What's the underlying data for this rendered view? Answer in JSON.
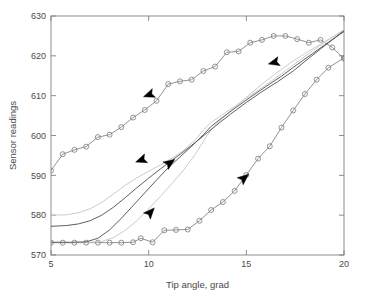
{
  "chart_data": {
    "type": "line",
    "title": "",
    "xlabel": "Tip angle, grad",
    "ylabel": "Sensor readings",
    "xlim": [
      5,
      20
    ],
    "ylim": [
      570,
      630
    ],
    "xticks": [
      5,
      10,
      15,
      20
    ],
    "yticks": [
      570,
      580,
      590,
      600,
      610,
      620,
      630
    ],
    "xtick_labels": [
      "5",
      "10",
      "15",
      "20"
    ],
    "ytick_labels": [
      "570",
      "580",
      "590",
      "600",
      "610",
      "620",
      "630"
    ],
    "grid": false,
    "legend": "none",
    "box": true,
    "colors": {
      "marker_curve": "#808080",
      "dark_line": "#555555",
      "light_line": "#c8c8c8",
      "arrow": "#000000",
      "axis": "#808080",
      "text": "#4a4a4a"
    },
    "series": [
      {
        "name": "upper-branch-markers",
        "style": "line-circle",
        "color": "#808080",
        "marker": "circle",
        "points": [
          [
            5.0,
            591.2
          ],
          [
            5.6,
            595.3
          ],
          [
            6.2,
            596.4
          ],
          [
            6.8,
            597.2
          ],
          [
            7.4,
            599.6
          ],
          [
            8.0,
            600.2
          ],
          [
            8.6,
            602.1
          ],
          [
            9.2,
            604.5
          ],
          [
            9.8,
            606.4
          ],
          [
            10.4,
            608.7
          ],
          [
            11.0,
            612.9
          ],
          [
            11.6,
            613.6
          ],
          [
            12.2,
            614.0
          ],
          [
            12.8,
            616.2
          ],
          [
            13.4,
            617.3
          ],
          [
            14.0,
            620.9
          ],
          [
            14.6,
            621.1
          ],
          [
            15.2,
            623.3
          ],
          [
            15.8,
            624.0
          ],
          [
            16.4,
            625.0
          ],
          [
            17.0,
            625.0
          ],
          [
            17.6,
            624.2
          ],
          [
            18.2,
            623.3
          ],
          [
            18.8,
            624.0
          ],
          [
            19.4,
            622.1
          ],
          [
            20.0,
            619.3
          ]
        ]
      },
      {
        "name": "lower-branch-markers",
        "style": "line-circle",
        "color": "#808080",
        "marker": "circle",
        "points": [
          [
            5.0,
            573.1
          ],
          [
            5.6,
            573.1
          ],
          [
            6.2,
            573.1
          ],
          [
            6.8,
            573.1
          ],
          [
            7.4,
            573.1
          ],
          [
            8.0,
            573.1
          ],
          [
            8.6,
            573.1
          ],
          [
            9.2,
            573.2
          ],
          [
            9.6,
            574.2
          ],
          [
            10.2,
            573.2
          ],
          [
            10.8,
            576.2
          ],
          [
            11.4,
            576.3
          ],
          [
            12.0,
            576.4
          ],
          [
            12.6,
            578.6
          ],
          [
            13.2,
            581.3
          ],
          [
            13.8,
            583.3
          ],
          [
            14.4,
            586.1
          ],
          [
            15.0,
            590.1
          ],
          [
            15.6,
            594.2
          ],
          [
            16.2,
            597.3
          ],
          [
            16.8,
            602.0
          ],
          [
            17.4,
            606.3
          ],
          [
            18.0,
            610.4
          ],
          [
            18.6,
            614.0
          ],
          [
            19.2,
            617.0
          ],
          [
            20.0,
            619.5
          ]
        ]
      },
      {
        "name": "light-ascending-line",
        "style": "line",
        "color": "#c8c8c8",
        "marker": "none",
        "points": [
          [
            5.0,
            573.1
          ],
          [
            6.0,
            573.1
          ],
          [
            7.0,
            573.2
          ],
          [
            7.6,
            573.4
          ],
          [
            8.2,
            574.4
          ],
          [
            8.8,
            576.2
          ],
          [
            9.4,
            578.6
          ],
          [
            10.0,
            581.6
          ],
          [
            10.6,
            584.7
          ],
          [
            11.2,
            588.0
          ],
          [
            11.8,
            591.4
          ],
          [
            12.4,
            595.4
          ],
          [
            13.0,
            600.1
          ],
          [
            13.4,
            602.6
          ],
          [
            13.8,
            604.4
          ],
          [
            14.4,
            607.1
          ],
          [
            15.0,
            609.6
          ],
          [
            15.8,
            612.9
          ],
          [
            16.6,
            615.9
          ],
          [
            17.4,
            618.7
          ],
          [
            18.2,
            621.2
          ],
          [
            19.0,
            623.5
          ],
          [
            19.6,
            625.2
          ],
          [
            20.0,
            626.4
          ]
        ]
      },
      {
        "name": "light-descending-line",
        "style": "line",
        "color": "#c8c8c8",
        "marker": "none",
        "points": [
          [
            5.0,
            580.0
          ],
          [
            5.8,
            580.1
          ],
          [
            6.4,
            580.6
          ],
          [
            7.0,
            581.6
          ],
          [
            7.6,
            583.2
          ],
          [
            8.2,
            585.3
          ],
          [
            8.8,
            587.5
          ],
          [
            9.4,
            589.4
          ],
          [
            10.0,
            591.0
          ],
          [
            10.6,
            592.6
          ],
          [
            11.2,
            594.3
          ],
          [
            11.8,
            596.3
          ],
          [
            12.4,
            599.0
          ],
          [
            12.8,
            601.4
          ],
          [
            13.2,
            603.3
          ],
          [
            13.8,
            605.3
          ],
          [
            14.4,
            607.3
          ],
          [
            15.2,
            610.0
          ],
          [
            16.0,
            612.7
          ],
          [
            16.8,
            615.5
          ],
          [
            17.6,
            618.4
          ],
          [
            18.4,
            621.3
          ],
          [
            19.2,
            624.0
          ],
          [
            20.0,
            626.6
          ]
        ]
      },
      {
        "name": "dark-ascending-line",
        "style": "line",
        "color": "#555555",
        "marker": "none",
        "points": [
          [
            5.0,
            573.2
          ],
          [
            6.0,
            573.2
          ],
          [
            6.8,
            573.3
          ],
          [
            7.4,
            574.2
          ],
          [
            8.0,
            576.3
          ],
          [
            8.6,
            579.2
          ],
          [
            9.2,
            582.4
          ],
          [
            9.8,
            585.6
          ],
          [
            10.4,
            588.8
          ],
          [
            11.0,
            591.9
          ],
          [
            11.6,
            594.6
          ],
          [
            12.2,
            597.3
          ],
          [
            12.8,
            600.2
          ],
          [
            13.2,
            602.3
          ],
          [
            13.8,
            604.6
          ],
          [
            14.4,
            606.8
          ],
          [
            15.2,
            609.6
          ],
          [
            16.0,
            612.3
          ],
          [
            16.8,
            614.9
          ],
          [
            17.6,
            617.8
          ],
          [
            18.4,
            620.6
          ],
          [
            19.2,
            623.4
          ],
          [
            20.0,
            626.1
          ]
        ]
      },
      {
        "name": "dark-descending-line",
        "style": "line",
        "color": "#555555",
        "marker": "none",
        "points": [
          [
            5.0,
            577.2
          ],
          [
            5.8,
            577.4
          ],
          [
            6.4,
            577.8
          ],
          [
            7.0,
            578.6
          ],
          [
            7.6,
            580.0
          ],
          [
            8.2,
            582.0
          ],
          [
            8.8,
            584.4
          ],
          [
            9.4,
            586.9
          ],
          [
            10.0,
            589.3
          ],
          [
            10.6,
            591.6
          ],
          [
            11.2,
            593.8
          ],
          [
            11.8,
            596.0
          ],
          [
            12.4,
            598.3
          ],
          [
            13.0,
            600.7
          ],
          [
            13.6,
            603.1
          ],
          [
            14.2,
            605.4
          ],
          [
            15.0,
            608.3
          ],
          [
            15.8,
            611.0
          ],
          [
            16.6,
            613.5
          ],
          [
            17.4,
            616.2
          ],
          [
            18.2,
            619.4
          ],
          [
            19.0,
            622.5
          ],
          [
            20.0,
            626.3
          ]
        ]
      }
    ],
    "annotations": [
      {
        "name": "arrow-upper-branch-left",
        "x": 10.0,
        "y": 610.2,
        "direction": "left-down",
        "angle": 200
      },
      {
        "name": "arrow-descending-mid",
        "x": 9.6,
        "y": 593.8,
        "direction": "left-down",
        "angle": 200
      },
      {
        "name": "arrow-ascending-mid",
        "x": 11.1,
        "y": 593.2,
        "direction": "right-up",
        "angle": 35
      },
      {
        "name": "arrow-ascending-low",
        "x": 10.1,
        "y": 580.8,
        "direction": "right-up",
        "angle": 48
      },
      {
        "name": "arrow-lower-branch-right",
        "x": 14.9,
        "y": 589.4,
        "direction": "right-up",
        "angle": 40
      },
      {
        "name": "arrow-upper-right",
        "x": 16.4,
        "y": 618.3,
        "direction": "left-down",
        "angle": 195
      }
    ]
  }
}
